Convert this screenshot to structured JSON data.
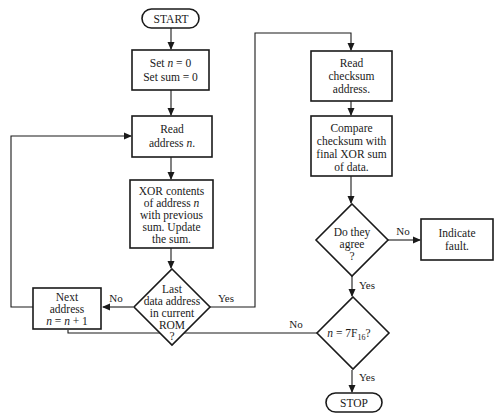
{
  "diagram": {
    "type": "flowchart",
    "nodes": {
      "start": {
        "label": "START"
      },
      "init": {
        "lines": [
          "Set n = 0",
          "Set sum = 0"
        ]
      },
      "read_address": {
        "lines": [
          "Read",
          "address n."
        ]
      },
      "xor": {
        "lines": [
          "XOR contents",
          "of address n",
          "with previous",
          "sum. Update",
          "the sum."
        ]
      },
      "last_address": {
        "lines": [
          "Last",
          "data address",
          "in current",
          "ROM",
          "?"
        ]
      },
      "next_address": {
        "lines": [
          "Next",
          "address",
          "n = n + 1"
        ]
      },
      "read_checksum": {
        "lines": [
          "Read",
          "checksum",
          "address."
        ]
      },
      "compare": {
        "lines": [
          "Compare",
          "checksum with",
          "final XOR sum",
          "of data."
        ]
      },
      "agree": {
        "lines": [
          "Do they",
          "agree",
          "?"
        ]
      },
      "fault": {
        "lines": [
          "Indicate",
          "fault."
        ]
      },
      "final_check": {
        "label": "n = 7F",
        "subscript": "16",
        "suffix": "?"
      },
      "stop": {
        "label": "STOP"
      }
    },
    "edge_labels": {
      "last_no": "No",
      "last_yes": "Yes",
      "agree_no": "No",
      "agree_yes": "Yes",
      "final_no": "No",
      "final_yes": "Yes"
    }
  }
}
